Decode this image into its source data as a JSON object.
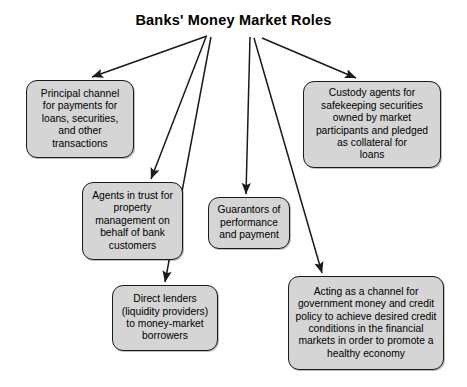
{
  "diagram": {
    "title": "Banks' Money Market Roles",
    "type": "hierarchy-fan-out",
    "colors": {
      "node_fill": "#d5d5d5",
      "node_border": "#1a1a1a",
      "background": "#ffffff",
      "text": "#000000",
      "arrow": "#1a1a1a"
    },
    "nodes": [
      {
        "id": "principal-channel",
        "label": "Principal channel\nfor payments for\nloans, securities,\nand other\ntransactions",
        "x": 26,
        "y": 80,
        "width": 108,
        "height": 78
      },
      {
        "id": "custody-agents",
        "label": "Custody agents for\nsafekeeping securities\nowned by market\nparticipants and pledged\nas collateral for\nloans",
        "x": 303,
        "y": 81,
        "width": 138,
        "height": 87
      },
      {
        "id": "agents-in-trust",
        "label": "Agents in trust for\nproperty\nmanagement on\nbehalf of bank\ncustomers",
        "x": 82,
        "y": 182,
        "width": 101,
        "height": 78
      },
      {
        "id": "guarantors",
        "label": "Guarantors of\nperformance\nand payment",
        "x": 208,
        "y": 197,
        "width": 82,
        "height": 52
      },
      {
        "id": "direct-lenders",
        "label": "Direct lenders\n(liquidity providers)\nto money-market\nborrowers",
        "x": 112,
        "y": 285,
        "width": 106,
        "height": 66
      },
      {
        "id": "policy-channel",
        "label": "Acting as a channel for\ngovernment money and credit\npolicy to achieve desired credit\nconditions in the financial\nmarkets in order to promote a\nhealthy economy",
        "x": 288,
        "y": 276,
        "width": 156,
        "height": 94
      }
    ],
    "arrows": [
      {
        "id": "arrow-to-principal-channel",
        "from": [
          207,
          36
        ],
        "to": [
          92,
          77
        ]
      },
      {
        "id": "arrow-to-custody-agents",
        "from": [
          262,
          38
        ],
        "to": [
          356,
          78
        ]
      },
      {
        "id": "arrow-to-agents-in-trust",
        "from": [
          206,
          37
        ],
        "to": [
          151,
          179
        ]
      },
      {
        "id": "arrow-to-guarantors",
        "from": [
          250,
          37
        ],
        "to": [
          246,
          194
        ]
      },
      {
        "id": "arrow-to-direct-lenders",
        "from": [
          211,
          37
        ],
        "to": [
          165,
          282
        ]
      },
      {
        "id": "arrow-to-policy-channel",
        "from": [
          254,
          38
        ],
        "to": [
          322,
          273
        ]
      }
    ]
  }
}
